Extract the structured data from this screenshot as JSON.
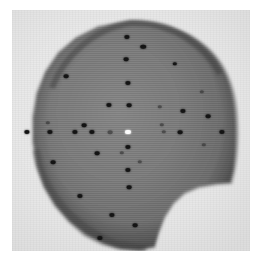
{
  "image": {
    "kind": "grayscale-micrograph",
    "width": 260,
    "height": 267,
    "alt_text": "Grayscale micrograph of a dark disc-shaped specimen with a notch removed from the lower-right edge, marked with an array of small dark indentation points and one bright point at the centre"
  },
  "canvas": {
    "page_background": "#ffffff",
    "plate_background": "#e8e8e8",
    "plate_left": 12,
    "plate_top": 10,
    "plate_width": 238,
    "plate_height": 241
  },
  "specimen": {
    "label": "specimen-disc",
    "fill_center": "#7d7d7d",
    "fill_edge": "#5a5a5a",
    "fill_rim": "#3f3f3f",
    "outline_path": "M 118 12 C 150 12 178 22 197 41 C 214 58 222 82 223 110 C 224 128 223 146 221 160 L 218 172 L 204 173 L 186 176 L 172 182 L 161 192 L 152 206 L 146 222 L 142 236 L 128 239 L 110 238 L 92 233 L 74 224 L 58 211 L 44 195 L 33 176 L 26 155 L 22 132 L 22 108 L 26 84 L 34 63 L 47 44 L 64 29 L 86 18 Z",
    "notch": {
      "description": "concave bite removed from lower-right quadrant",
      "present": true
    }
  },
  "marks": {
    "description": "indentation points arrayed in a cross / grid pattern over the disc",
    "dark_color": "#141414",
    "bright_color": "#fbfbfb",
    "count_total": 45,
    "points": [
      {
        "x": 115,
        "y": 27,
        "r": 2.6,
        "tone": "dark"
      },
      {
        "x": 131,
        "y": 37,
        "r": 2.8,
        "tone": "dark"
      },
      {
        "x": 114,
        "y": 49,
        "r": 2.4,
        "tone": "dark"
      },
      {
        "x": 163,
        "y": 54,
        "r": 2.2,
        "tone": "dark"
      },
      {
        "x": 54,
        "y": 66,
        "r": 2.4,
        "tone": "dark"
      },
      {
        "x": 116,
        "y": 73,
        "r": 2.6,
        "tone": "dark"
      },
      {
        "x": 190,
        "y": 82,
        "r": 2.2,
        "tone": "faint"
      },
      {
        "x": 97,
        "y": 95,
        "r": 2.6,
        "tone": "dark"
      },
      {
        "x": 117,
        "y": 95,
        "r": 2.4,
        "tone": "dark"
      },
      {
        "x": 148,
        "y": 97,
        "r": 2.2,
        "tone": "faint"
      },
      {
        "x": 171,
        "y": 101,
        "r": 2.6,
        "tone": "dark"
      },
      {
        "x": 196,
        "y": 106,
        "r": 2.4,
        "tone": "dark"
      },
      {
        "x": 36,
        "y": 113,
        "r": 2.2,
        "tone": "faint"
      },
      {
        "x": 72,
        "y": 115,
        "r": 2.4,
        "tone": "dark"
      },
      {
        "x": 150,
        "y": 115,
        "r": 2.2,
        "tone": "faint"
      },
      {
        "x": 15,
        "y": 122,
        "r": 2.6,
        "tone": "dark"
      },
      {
        "x": 38,
        "y": 122,
        "r": 2.6,
        "tone": "dark"
      },
      {
        "x": 63,
        "y": 122,
        "r": 2.6,
        "tone": "dark"
      },
      {
        "x": 80,
        "y": 122,
        "r": 2.6,
        "tone": "dark"
      },
      {
        "x": 98,
        "y": 122,
        "r": 2.4,
        "tone": "faint"
      },
      {
        "x": 116,
        "y": 122,
        "r": 3.0,
        "tone": "bright"
      },
      {
        "x": 152,
        "y": 122,
        "r": 2.2,
        "tone": "faint"
      },
      {
        "x": 168,
        "y": 122,
        "r": 2.4,
        "tone": "dark"
      },
      {
        "x": 210,
        "y": 122,
        "r": 2.6,
        "tone": "dark"
      },
      {
        "x": 116,
        "y": 137,
        "r": 2.6,
        "tone": "dark"
      },
      {
        "x": 192,
        "y": 135,
        "r": 2.2,
        "tone": "faint"
      },
      {
        "x": 85,
        "y": 143,
        "r": 2.4,
        "tone": "dark"
      },
      {
        "x": 110,
        "y": 143,
        "r": 2.2,
        "tone": "faint"
      },
      {
        "x": 41,
        "y": 152,
        "r": 2.4,
        "tone": "dark"
      },
      {
        "x": 128,
        "y": 152,
        "r": 2.2,
        "tone": "faint"
      },
      {
        "x": 116,
        "y": 160,
        "r": 2.6,
        "tone": "dark"
      },
      {
        "x": 117,
        "y": 177,
        "r": 2.4,
        "tone": "dark"
      },
      {
        "x": 68,
        "y": 186,
        "r": 2.6,
        "tone": "dark"
      },
      {
        "x": 100,
        "y": 205,
        "r": 2.6,
        "tone": "dark"
      },
      {
        "x": 123,
        "y": 215,
        "r": 2.4,
        "tone": "dark"
      },
      {
        "x": 88,
        "y": 228,
        "r": 2.6,
        "tone": "dark"
      }
    ]
  }
}
